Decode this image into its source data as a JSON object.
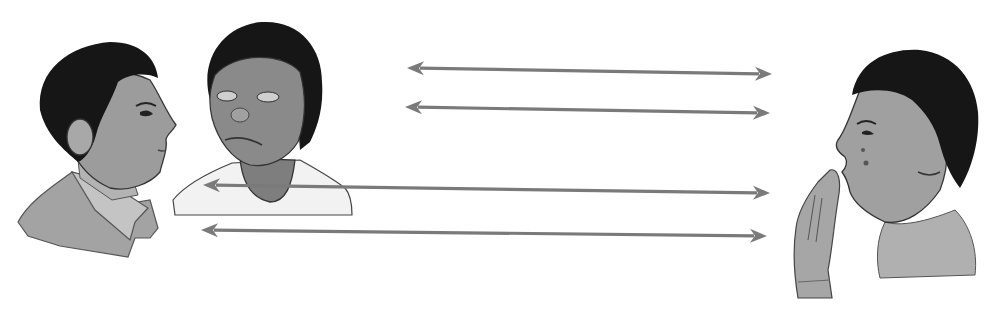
{
  "canvas": {
    "width": 997,
    "height": 309,
    "background": "#ffffff"
  },
  "colors": {
    "arrow": "#7a7a7a",
    "hair": "#161616",
    "skin_boy_left": "#9c9c9c",
    "skin_girl_middle": "#8a8a8a",
    "skin_boy_right": "#a0a0a0",
    "shirt_left": "#a3a3a3",
    "shirt_middle": "#f2f2f2",
    "shirt_right": "#b0b0b0",
    "outline": "#3a3a3a"
  },
  "figures": [
    {
      "id": "boy-left",
      "label": "boy in profile facing right",
      "x": 15,
      "y": 35,
      "w": 165,
      "h": 225
    },
    {
      "id": "girl-middle",
      "label": "girl looking down",
      "x": 170,
      "y": 20,
      "w": 185,
      "h": 200
    },
    {
      "id": "boy-right",
      "label": "boy whispering with hand raised, facing left",
      "x": 785,
      "y": 50,
      "w": 200,
      "h": 250
    }
  ],
  "arrows": [
    {
      "x1": 407,
      "y1": 68,
      "x2": 772,
      "y2": 74
    },
    {
      "x1": 405,
      "y1": 107,
      "x2": 770,
      "y2": 113
    },
    {
      "x1": 203,
      "y1": 185,
      "x2": 770,
      "y2": 193
    },
    {
      "x1": 201,
      "y1": 230,
      "x2": 767,
      "y2": 236
    }
  ]
}
